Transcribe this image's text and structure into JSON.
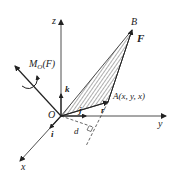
{
  "diagram": {
    "type": "3d-moment-vector",
    "colors": {
      "stroke": "#222222",
      "hatch": "#333333",
      "background": "#ffffff"
    },
    "axes": {
      "x": {
        "label": "x",
        "unit_vector": "i"
      },
      "y": {
        "label": "y",
        "unit_vector": "j"
      },
      "z": {
        "label": "z",
        "unit_vector": "k"
      }
    },
    "labels": {
      "origin": "O",
      "point_b": "B",
      "force": "F",
      "point_a": "A(x, y, x)",
      "position_vector": "r",
      "distance": "d",
      "moment": "M",
      "moment_sub": "O",
      "moment_arg": "(F)",
      "unit_i": "i",
      "unit_j": "j",
      "unit_k": "k"
    }
  }
}
